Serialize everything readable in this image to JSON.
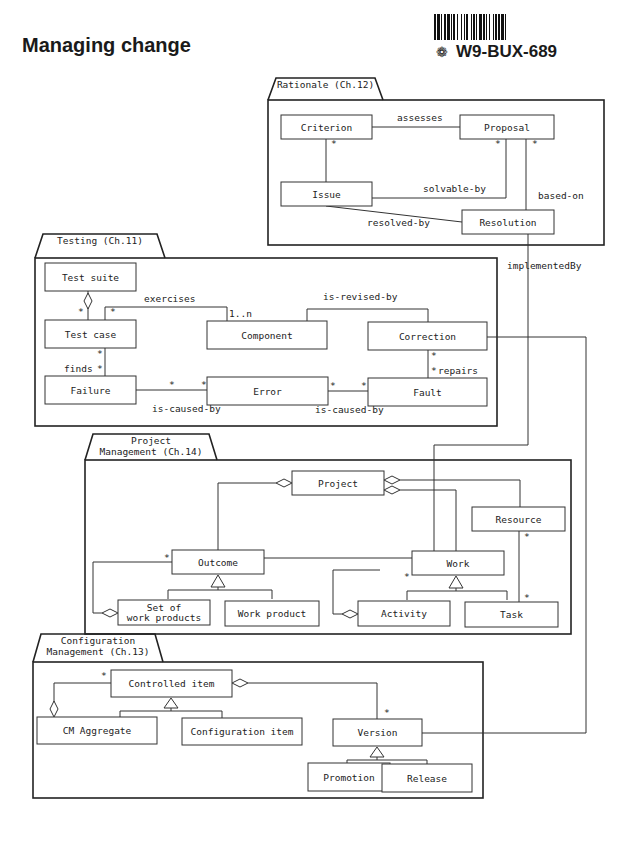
{
  "page": {
    "title": "Managing change",
    "stamp_code": "W9-BUX-689",
    "stamp_glyph": "❁"
  },
  "packages": [
    {
      "id": "rationale",
      "label_lines": [
        "Rationale (Ch.12)"
      ],
      "x": 268,
      "y": 100,
      "w": 336,
      "h": 145,
      "tab_w": 115,
      "tab_h": 22
    },
    {
      "id": "testing",
      "label_lines": [
        "Testing (Ch.11)"
      ],
      "x": 35,
      "y": 258,
      "w": 462,
      "h": 168,
      "tab_w": 130,
      "tab_h": 24
    },
    {
      "id": "project",
      "label_lines": [
        "Project",
        "Management (Ch.14)"
      ],
      "x": 85,
      "y": 460,
      "w": 486,
      "h": 174,
      "tab_w": 132,
      "tab_h": 26
    },
    {
      "id": "config",
      "label_lines": [
        "Configuration",
        "Management (Ch.13)"
      ],
      "x": 33,
      "y": 662,
      "w": 450,
      "h": 136,
      "tab_w": 130,
      "tab_h": 28
    }
  ],
  "classes": [
    {
      "id": "criterion",
      "label_lines": [
        "Criterion"
      ],
      "x": 281,
      "y": 115,
      "w": 91,
      "h": 24
    },
    {
      "id": "proposal",
      "label_lines": [
        "Proposal"
      ],
      "x": 460,
      "y": 115,
      "w": 94,
      "h": 24
    },
    {
      "id": "issue",
      "label_lines": [
        "Issue"
      ],
      "x": 281,
      "y": 182,
      "w": 91,
      "h": 24
    },
    {
      "id": "resolution",
      "label_lines": [
        "Resolution"
      ],
      "x": 462,
      "y": 210,
      "w": 92,
      "h": 24
    },
    {
      "id": "test-suite",
      "label_lines": [
        "Test suite"
      ],
      "x": 45,
      "y": 263,
      "w": 91,
      "h": 28
    },
    {
      "id": "test-case",
      "label_lines": [
        "Test case"
      ],
      "x": 45,
      "y": 320,
      "w": 91,
      "h": 28
    },
    {
      "id": "component",
      "label_lines": [
        "Component"
      ],
      "x": 207,
      "y": 321,
      "w": 120,
      "h": 28
    },
    {
      "id": "correction",
      "label_lines": [
        "Correction"
      ],
      "x": 368,
      "y": 322,
      "w": 119,
      "h": 28
    },
    {
      "id": "failure",
      "label_lines": [
        "Failure"
      ],
      "x": 45,
      "y": 376,
      "w": 91,
      "h": 28
    },
    {
      "id": "error",
      "label_lines": [
        "Error"
      ],
      "x": 207,
      "y": 377,
      "w": 121,
      "h": 28
    },
    {
      "id": "fault",
      "label_lines": [
        "Fault"
      ],
      "x": 368,
      "y": 378,
      "w": 119,
      "h": 28
    },
    {
      "id": "project",
      "label_lines": [
        "Project"
      ],
      "x": 292,
      "y": 471,
      "w": 92,
      "h": 24
    },
    {
      "id": "resource",
      "label_lines": [
        "Resource"
      ],
      "x": 472,
      "y": 507,
      "w": 93,
      "h": 24
    },
    {
      "id": "outcome",
      "label_lines": [
        "Outcome"
      ],
      "x": 172,
      "y": 550,
      "w": 92,
      "h": 24
    },
    {
      "id": "work",
      "label_lines": [
        "Work"
      ],
      "x": 412,
      "y": 551,
      "w": 92,
      "h": 24
    },
    {
      "id": "set-of-work-products",
      "label_lines": [
        "Set of",
        "work products"
      ],
      "x": 118,
      "y": 600,
      "w": 92,
      "h": 25
    },
    {
      "id": "work-product",
      "label_lines": [
        "Work product"
      ],
      "x": 225,
      "y": 601,
      "w": 94,
      "h": 25
    },
    {
      "id": "activity",
      "label_lines": [
        "Activity"
      ],
      "x": 358,
      "y": 601,
      "w": 92,
      "h": 25
    },
    {
      "id": "task",
      "label_lines": [
        "Task"
      ],
      "x": 465,
      "y": 602,
      "w": 93,
      "h": 25
    },
    {
      "id": "controlled-item",
      "label_lines": [
        "Controlled item"
      ],
      "x": 111,
      "y": 670,
      "w": 121,
      "h": 27
    },
    {
      "id": "cm-aggregate",
      "label_lines": [
        "CM Aggregate"
      ],
      "x": 37,
      "y": 717,
      "w": 120,
      "h": 27
    },
    {
      "id": "configuration-item",
      "label_lines": [
        "Configuration item"
      ],
      "x": 182,
      "y": 718,
      "w": 120,
      "h": 27
    },
    {
      "id": "version",
      "label_lines": [
        "Version"
      ],
      "x": 333,
      "y": 719,
      "w": 89,
      "h": 27
    },
    {
      "id": "promotion",
      "label_lines": [
        "Promotion"
      ],
      "x": 308,
      "y": 763,
      "w": 82,
      "h": 28
    },
    {
      "id": "release",
      "label_lines": [
        "Release"
      ],
      "x": 382,
      "y": 764,
      "w": 90,
      "h": 28
    }
  ],
  "associations": [
    {
      "id": "assesses",
      "label": "assesses",
      "points": [
        [
          372,
          127
        ],
        [
          460,
          127
        ]
      ],
      "label_pos": [
        397,
        121
      ]
    },
    {
      "id": "criterion-issue",
      "label": "",
      "points": [
        [
          326,
          139
        ],
        [
          326,
          182
        ]
      ],
      "label_pos": null
    },
    {
      "id": "solvable-by",
      "label": "solvable-by",
      "points": [
        [
          372,
          198
        ],
        [
          506,
          198
        ],
        [
          506,
          139
        ]
      ],
      "label_pos": [
        423,
        192
      ]
    },
    {
      "id": "based-on",
      "label": "based-on",
      "points": [
        [
          526,
          139
        ],
        [
          526,
          210
        ]
      ],
      "label_pos": [
        538,
        199
      ]
    },
    {
      "id": "resolved-by",
      "label": "resolved-by",
      "points": [
        [
          326,
          206
        ],
        [
          462,
          222
        ]
      ],
      "label_pos": [
        367,
        226
      ]
    },
    {
      "id": "implemented-by",
      "label": "implementedBy",
      "points": [
        [
          528,
          234
        ],
        [
          528,
          445
        ],
        [
          434,
          445
        ],
        [
          434,
          551
        ]
      ],
      "label_pos": [
        507,
        269
      ]
    },
    {
      "id": "test-suite-case",
      "label": "",
      "points": [
        [
          88,
          291
        ],
        [
          88,
          320
        ]
      ],
      "label_pos": null
    },
    {
      "id": "exercises",
      "label": "exercises",
      "points": [
        [
          105,
          320
        ],
        [
          105,
          307
        ],
        [
          227,
          307
        ],
        [
          227,
          321
        ]
      ],
      "label_pos": [
        144,
        302
      ]
    },
    {
      "id": "is-revised-by",
      "label": "is-revised-by",
      "points": [
        [
          307,
          321
        ],
        [
          307,
          309
        ],
        [
          428,
          309
        ],
        [
          428,
          322
        ]
      ],
      "label_pos": [
        323,
        300
      ]
    },
    {
      "id": "finds",
      "label": "finds",
      "points": [
        [
          105,
          348
        ],
        [
          105,
          376
        ]
      ],
      "label_pos": [
        64,
        372
      ]
    },
    {
      "id": "failure-error",
      "label": "is-caused-by",
      "points": [
        [
          136,
          390
        ],
        [
          207,
          390
        ]
      ],
      "label_pos": [
        152,
        412
      ]
    },
    {
      "id": "error-fault",
      "label": "is-caused-by",
      "points": [
        [
          328,
          391
        ],
        [
          368,
          391
        ]
      ],
      "label_pos": [
        315,
        413
      ]
    },
    {
      "id": "repairs",
      "label": "repairs",
      "points": [
        [
          428,
          350
        ],
        [
          428,
          378
        ]
      ],
      "label_pos": [
        438,
        374
      ]
    },
    {
      "id": "correction-version",
      "label": "",
      "points": [
        [
          487,
          337
        ],
        [
          586,
          337
        ],
        [
          586,
          733
        ],
        [
          422,
          733
        ]
      ],
      "label_pos": null
    },
    {
      "id": "project-outcome",
      "label": "",
      "points": [
        [
          276,
          483
        ],
        [
          218,
          483
        ],
        [
          218,
          550
        ]
      ],
      "label_pos": null
    },
    {
      "id": "project-resource",
      "label": "",
      "points": [
        [
          400,
          480
        ],
        [
          520,
          480
        ],
        [
          520,
          507
        ]
      ],
      "label_pos": null
    },
    {
      "id": "project-work",
      "label": "",
      "points": [
        [
          400,
          490
        ],
        [
          456,
          490
        ],
        [
          456,
          551
        ]
      ],
      "label_pos": null
    },
    {
      "id": "resource-task",
      "label": "",
      "points": [
        [
          519,
          531
        ],
        [
          519,
          602
        ]
      ],
      "label_pos": null
    },
    {
      "id": "outcome-work",
      "label": "",
      "points": [
        [
          264,
          558
        ],
        [
          412,
          558
        ]
      ],
      "label_pos": null
    },
    {
      "id": "outcome-set-aggregation",
      "label": "",
      "points": [
        [
          172,
          562
        ],
        [
          93,
          562
        ],
        [
          93,
          613
        ],
        [
          102,
          613
        ]
      ],
      "label_pos": null
    },
    {
      "id": "work-activity-aggregation",
      "label": "",
      "points": [
        [
          380,
          570
        ],
        [
          333,
          570
        ],
        [
          333,
          614
        ],
        [
          342,
          614
        ]
      ],
      "label_pos": null
    },
    {
      "id": "controlled-cm-aggregation",
      "label": "",
      "points": [
        [
          111,
          683
        ],
        [
          54,
          683
        ],
        [
          54,
          702
        ]
      ],
      "label_pos": null
    },
    {
      "id": "controlled-version",
      "label": "",
      "points": [
        [
          248,
          683
        ],
        [
          377,
          683
        ],
        [
          377,
          719
        ]
      ],
      "label_pos": null
    }
  ],
  "multiplicities": [
    {
      "text": "*",
      "x": 331,
      "y": 147
    },
    {
      "text": "*",
      "x": 495,
      "y": 147
    },
    {
      "text": "*",
      "x": 532,
      "y": 147
    },
    {
      "text": "*",
      "x": 78,
      "y": 315
    },
    {
      "text": "*",
      "x": 110,
      "y": 315
    },
    {
      "text": "1..n",
      "x": 229,
      "y": 317
    },
    {
      "text": "*",
      "x": 97,
      "y": 357
    },
    {
      "text": "*",
      "x": 97,
      "y": 372
    },
    {
      "text": "*",
      "x": 169,
      "y": 388
    },
    {
      "text": "*",
      "x": 201,
      "y": 388
    },
    {
      "text": "*",
      "x": 330,
      "y": 389
    },
    {
      "text": "*",
      "x": 361,
      "y": 389
    },
    {
      "text": "*",
      "x": 431,
      "y": 359
    },
    {
      "text": "*",
      "x": 431,
      "y": 374
    },
    {
      "text": "*",
      "x": 524,
      "y": 540
    },
    {
      "text": "*",
      "x": 524,
      "y": 601
    },
    {
      "text": "*",
      "x": 164,
      "y": 561
    },
    {
      "text": "*",
      "x": 404,
      "y": 580
    },
    {
      "text": "*",
      "x": 101,
      "y": 679
    },
    {
      "text": "*",
      "x": 384,
      "y": 716
    }
  ],
  "aggregations": [
    {
      "id": "suite-diamond",
      "cx": 88,
      "cy": 301,
      "orient": "v"
    },
    {
      "id": "project-outcome-diamond",
      "cx": 284,
      "cy": 483,
      "orient": "h"
    },
    {
      "id": "project-resource-diamond",
      "cx": 392,
      "cy": 480,
      "orient": "h"
    },
    {
      "id": "project-work-diamond",
      "cx": 392,
      "cy": 490,
      "orient": "h"
    },
    {
      "id": "set-diamond",
      "cx": 110,
      "cy": 613,
      "orient": "h"
    },
    {
      "id": "activity-diamond",
      "cx": 350,
      "cy": 614,
      "orient": "h"
    },
    {
      "id": "cm-aggregate-diamond",
      "cx": 54,
      "cy": 709,
      "orient": "v"
    },
    {
      "id": "controlled-diamond",
      "cx": 240,
      "cy": 683,
      "orient": "h"
    }
  ],
  "generalizations": [
    {
      "id": "outcome-gen",
      "apex_x": 218,
      "apex_y": 575,
      "bar_y": 590,
      "left_x": 168,
      "right_x": 272
    },
    {
      "id": "work-gen",
      "apex_x": 456,
      "apex_y": 576,
      "bar_y": 591,
      "left_x": 407,
      "right_x": 507
    },
    {
      "id": "controlled-gen",
      "apex_x": 171,
      "apex_y": 698,
      "bar_y": 711,
      "left_x": 120,
      "right_x": 222
    },
    {
      "id": "version-gen",
      "apex_x": 377,
      "apex_y": 747,
      "bar_y": 760,
      "left_x": 347,
      "right_x": 427
    }
  ]
}
